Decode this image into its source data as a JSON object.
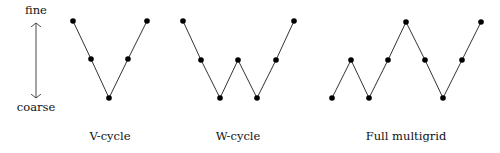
{
  "axis": {
    "top_label": "fine",
    "bottom_label": "coarse",
    "x": 36,
    "label_top_y": 14,
    "label_bottom_y": 111,
    "arrow_y1": 23,
    "arrow_y2": 98
  },
  "colors": {
    "line": "#333333",
    "node": "#000000",
    "text": "#111111"
  },
  "diagrams": [
    {
      "name": "V-cycle",
      "label": "V-cycle",
      "label_x": 110,
      "label_y": 140,
      "points": [
        [
          73,
          21
        ],
        [
          91,
          59
        ],
        [
          109,
          98
        ],
        [
          128,
          59
        ],
        [
          147,
          21
        ]
      ]
    },
    {
      "name": "W-cycle",
      "label": "W-cycle",
      "label_x": 238,
      "label_y": 140,
      "points": [
        [
          183,
          21
        ],
        [
          201,
          60
        ],
        [
          220,
          98
        ],
        [
          238,
          60
        ],
        [
          257,
          98
        ],
        [
          276,
          60
        ],
        [
          294,
          21
        ]
      ]
    },
    {
      "name": "Full multigrid",
      "label": "Full multigrid",
      "label_x": 406,
      "label_y": 140,
      "points": [
        [
          332,
          98
        ],
        [
          351,
          60
        ],
        [
          369,
          98
        ],
        [
          388,
          60
        ],
        [
          406,
          22
        ],
        [
          425,
          60
        ],
        [
          443,
          98
        ],
        [
          462,
          60
        ],
        [
          481,
          22
        ]
      ]
    }
  ]
}
